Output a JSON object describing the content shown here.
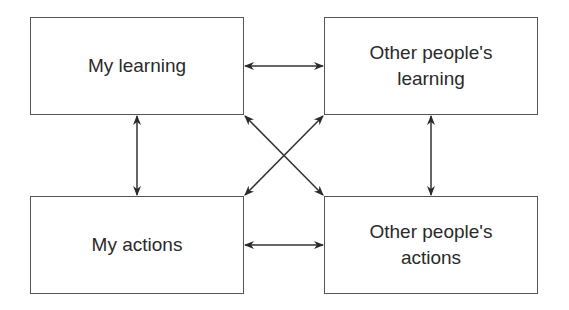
{
  "diagram": {
    "nodes": [
      {
        "id": "my-learning",
        "label": "My learning"
      },
      {
        "id": "others-learning",
        "label": "Other people's\nlearning"
      },
      {
        "id": "my-actions",
        "label": "My actions"
      },
      {
        "id": "others-actions",
        "label": "Other people's\nactions"
      }
    ],
    "edges": [
      {
        "from": "my-learning",
        "to": "others-learning",
        "bidirectional": true
      },
      {
        "from": "my-actions",
        "to": "others-actions",
        "bidirectional": true
      },
      {
        "from": "my-learning",
        "to": "my-actions",
        "bidirectional": true
      },
      {
        "from": "others-learning",
        "to": "others-actions",
        "bidirectional": true
      },
      {
        "from": "my-learning",
        "to": "others-actions",
        "bidirectional": true
      },
      {
        "from": "others-learning",
        "to": "my-actions",
        "bidirectional": true
      }
    ],
    "colors": {
      "stroke": "#555555",
      "text": "#2a2a2a",
      "background": "#ffffff"
    }
  }
}
